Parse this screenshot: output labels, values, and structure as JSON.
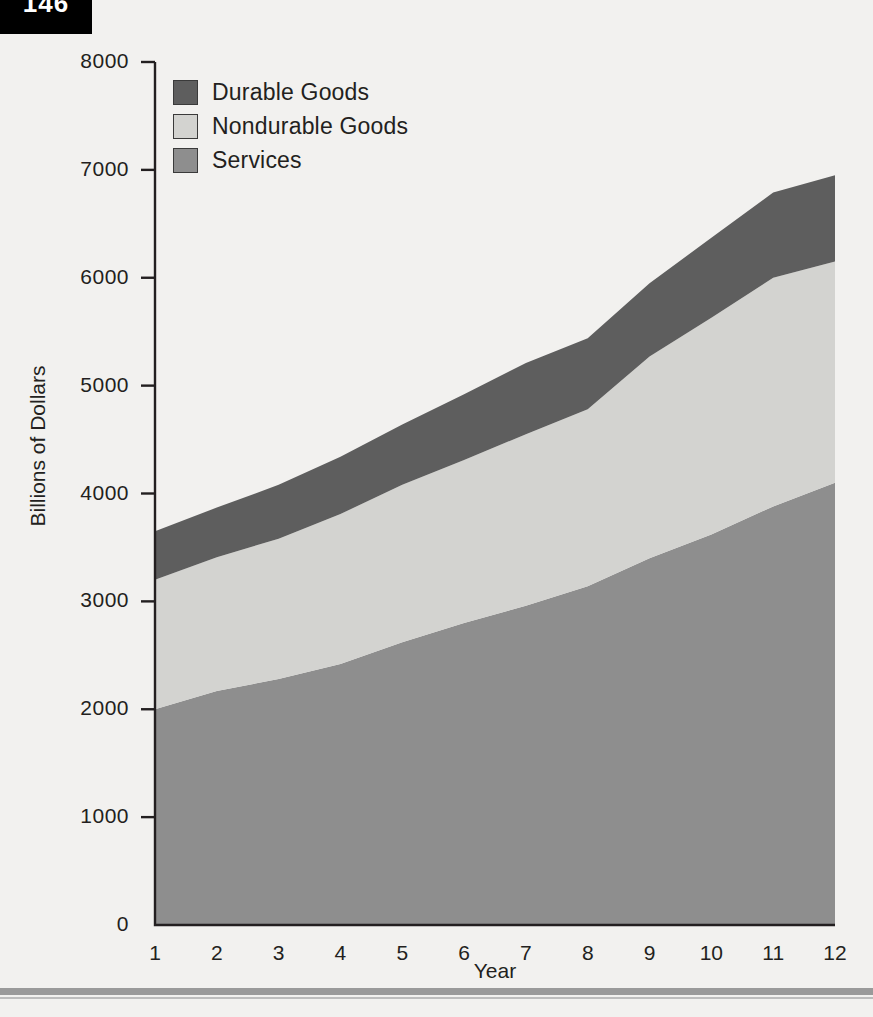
{
  "page": {
    "number": "146"
  },
  "chart_data": {
    "type": "area",
    "title": "",
    "subtitle": "",
    "xlabel": "Year",
    "ylabel": "Billions of Dollars",
    "stacked": true,
    "grid": false,
    "legend_position": "top-left",
    "x": [
      1,
      2,
      3,
      4,
      5,
      6,
      7,
      8,
      9,
      10,
      11,
      12
    ],
    "categories": [
      "1",
      "2",
      "3",
      "4",
      "5",
      "6",
      "7",
      "8",
      "9",
      "10",
      "11",
      "12"
    ],
    "xlim": [
      1,
      12
    ],
    "ylim": [
      0,
      8000
    ],
    "ytick_labels": [
      "8000",
      "7000",
      "6000",
      "5000",
      "4000",
      "3000",
      "2000",
      "1000",
      "0"
    ],
    "ytick_values": [
      8000,
      7000,
      6000,
      5000,
      4000,
      3000,
      2000,
      1000,
      0
    ],
    "xtick_labels": [
      "1",
      "2",
      "3",
      "4",
      "5",
      "6",
      "7",
      "8",
      "9",
      "10",
      "11",
      "12"
    ],
    "series": [
      {
        "name": "Services",
        "color": "#8e8e8e",
        "stack_order": 0,
        "values": [
          2000,
          2170,
          2280,
          2420,
          2620,
          2800,
          2960,
          3140,
          3400,
          3620,
          3880,
          4100
        ]
      },
      {
        "name": "Nondurable Goods",
        "color": "#d3d3d0",
        "stack_order": 1,
        "values": [
          1200,
          1240,
          1300,
          1390,
          1460,
          1510,
          1590,
          1640,
          1870,
          2010,
          2120,
          2050
        ]
      },
      {
        "name": "Durable Goods",
        "color": "#5e5e5e",
        "stack_order": 2,
        "values": [
          450,
          460,
          500,
          530,
          560,
          610,
          660,
          660,
          680,
          740,
          790,
          800
        ]
      }
    ],
    "cumulative": {
      "services_top": [
        2000,
        2170,
        2280,
        2420,
        2620,
        2800,
        2960,
        3140,
        3400,
        3620,
        3880,
        4100
      ],
      "nondurable_top": [
        3200,
        3410,
        3580,
        3810,
        4080,
        4310,
        4550,
        4780,
        5270,
        5630,
        6000,
        6150
      ],
      "durable_top": [
        3650,
        3870,
        4080,
        4340,
        4640,
        4920,
        5210,
        5440,
        5950,
        6370,
        6790,
        6950
      ]
    }
  },
  "legend": {
    "items": [
      {
        "label": "Durable Goods",
        "color": "#5e5e5e"
      },
      {
        "label": "Nondurable Goods",
        "color": "#d3d3d0"
      },
      {
        "label": "Services",
        "color": "#8e8e8e"
      }
    ]
  },
  "colors": {
    "durable": "#5e5e5e",
    "nondurable": "#d3d3d0",
    "services": "#8e8e8e",
    "axis": "#231f20",
    "background": "#f2f1ef"
  }
}
